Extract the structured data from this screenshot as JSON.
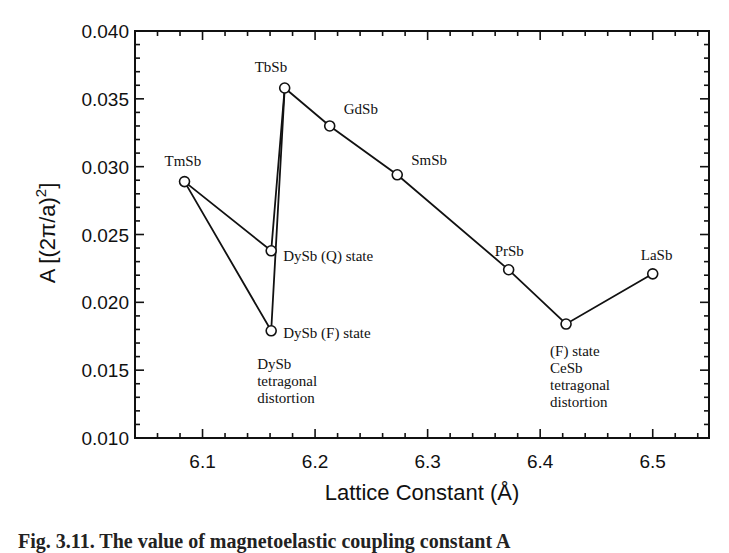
{
  "chart_data": {
    "type": "line",
    "title": "",
    "xlabel": "Lattice Constant (Å)",
    "ylabel": "A [(2π/a)²]",
    "xlim": [
      6.04,
      6.55
    ],
    "ylim": [
      0.01,
      0.04
    ],
    "x_ticks": [
      "6.1",
      "6.2",
      "6.3",
      "6.4",
      "6.5"
    ],
    "y_ticks": [
      "0.010",
      "0.015",
      "0.020",
      "0.025",
      "0.030",
      "0.035",
      "0.040"
    ],
    "grid": false,
    "legend": null,
    "points": [
      {
        "name": "TmSb",
        "x": 6.084,
        "y": 0.0289,
        "label": [
          "TmSb"
        ]
      },
      {
        "name": "DySb (Q) state",
        "x": 6.161,
        "y": 0.0238,
        "label": [
          "DySb (Q) state"
        ]
      },
      {
        "name": "DySb (F) state",
        "x": 6.161,
        "y": 0.0179,
        "label": [
          "DySb (F) state"
        ]
      },
      {
        "name": "TbSb",
        "x": 6.173,
        "y": 0.0358,
        "label": [
          "TbSb"
        ]
      },
      {
        "name": "GdSb",
        "x": 6.213,
        "y": 0.033,
        "label": [
          "GdSb"
        ]
      },
      {
        "name": "SmSb",
        "x": 6.273,
        "y": 0.0294,
        "label": [
          "SmSb"
        ]
      },
      {
        "name": "PrSb",
        "x": 6.372,
        "y": 0.0224,
        "label": [
          "PrSb"
        ]
      },
      {
        "name": "CeSb (F) state",
        "x": 6.423,
        "y": 0.0184,
        "label": [
          "(F) state",
          "CeSb",
          "tetragonal",
          "distortion"
        ]
      },
      {
        "name": "LaSb",
        "x": 6.5,
        "y": 0.0221,
        "label": [
          "LaSb"
        ]
      }
    ],
    "series": [
      {
        "name": "path-Q",
        "points": [
          "TmSb",
          "DySb (Q) state",
          "TbSb"
        ]
      },
      {
        "name": "path-F",
        "points": [
          "TmSb",
          "DySb (F) state",
          "TbSb"
        ]
      },
      {
        "name": "main",
        "points": [
          "TbSb",
          "GdSb",
          "SmSb",
          "PrSb",
          "CeSb (F) state",
          "LaSb"
        ]
      }
    ],
    "annotations": [
      {
        "text": [
          "DySb",
          "tetragonal",
          "distortion"
        ],
        "near": "DySb (F) state"
      }
    ]
  },
  "caption": "Fig. 3.11. The value of magnetoelastic coupling constant A"
}
